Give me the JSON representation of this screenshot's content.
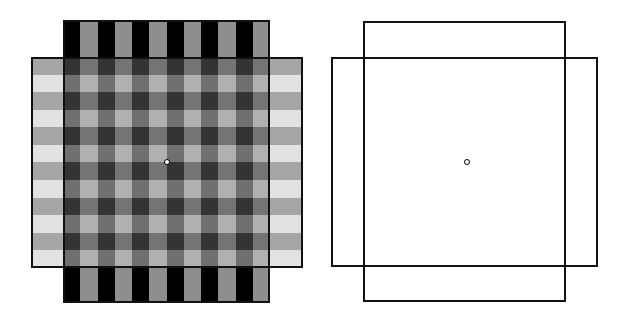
{
  "figure": {
    "left_panel": {
      "description": "overlapping striped squares",
      "vertical_rect": {
        "x": 63,
        "y": 20,
        "w": 207,
        "h": 283,
        "stripes": 12,
        "colors": [
          "#000000",
          "#8e8e8e"
        ]
      },
      "horizontal_rect": {
        "x": 31,
        "y": 57,
        "w": 272,
        "h": 211,
        "stripes": 12,
        "colors": [
          "#5f5f5f",
          "#cccccc"
        ],
        "opacity": 0.55
      },
      "center_dot": {
        "x": 167,
        "y": 162
      }
    },
    "right_panel": {
      "description": "outline-only version of the overlapping rectangles",
      "vertical_rect": {
        "x": 363,
        "y": 21,
        "w": 203,
        "h": 281
      },
      "horizontal_rect": {
        "x": 331,
        "y": 57,
        "w": 267,
        "h": 210
      },
      "center_dot": {
        "x": 467,
        "y": 162
      }
    }
  }
}
